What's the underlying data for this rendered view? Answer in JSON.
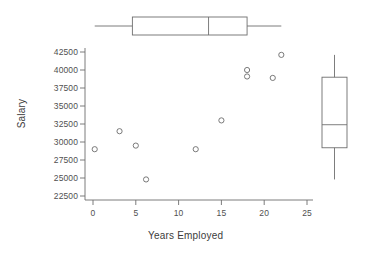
{
  "chart_data": {
    "type": "scatter",
    "title": "",
    "xlabel": "Years Employed",
    "ylabel": "Salary",
    "xlim": [
      -1.5,
      26.5
    ],
    "ylim": [
      21800,
      43600
    ],
    "grid": false,
    "legend": "none",
    "x_ticks": [
      0,
      5,
      10,
      15,
      20,
      25
    ],
    "x_tick_labels": [
      "0",
      "5",
      "10",
      "15",
      "20",
      "25"
    ],
    "y_ticks": [
      22500,
      25000,
      27500,
      30000,
      32500,
      35000,
      37500,
      40000,
      42500
    ],
    "y_tick_labels": [
      "22500",
      "25000",
      "27500",
      "30000",
      "32500",
      "35000",
      "37500",
      "40000",
      "42500"
    ],
    "x": [
      0.2,
      3.1,
      5.0,
      6.2,
      12.0,
      15.0,
      18.0,
      18.0,
      21.0,
      22.0
    ],
    "y": [
      29000,
      31500,
      29500,
      24800,
      29000,
      33000,
      40000,
      39100,
      38900,
      42100
    ],
    "points": [
      {
        "x": 0.2,
        "y": 29000
      },
      {
        "x": 3.1,
        "y": 31500
      },
      {
        "x": 5.0,
        "y": 29500
      },
      {
        "x": 6.2,
        "y": 24800
      },
      {
        "x": 12.0,
        "y": 29000
      },
      {
        "x": 15.0,
        "y": 33000
      },
      {
        "x": 18.0,
        "y": 40000
      },
      {
        "x": 18.0,
        "y": 39100
      },
      {
        "x": 21.0,
        "y": 38900
      },
      {
        "x": 22.0,
        "y": 42100
      }
    ],
    "marker": "open-circle",
    "marker_size": 4,
    "boxplot_x": {
      "orientation": "horizontal",
      "variable": "Years Employed",
      "min": 0.2,
      "q1": 4.6,
      "median": 13.5,
      "q3": 18.0,
      "max": 22.0
    },
    "boxplot_y": {
      "orientation": "vertical",
      "variable": "Salary",
      "min": 24800,
      "q1": 29200,
      "median": 32400,
      "q3": 39000,
      "max": 42100
    }
  },
  "labels": {
    "xaxis": "Years Employed",
    "yaxis": "Salary"
  },
  "colors": {
    "line": "#6e6e6e",
    "marker": "#6b6b6b",
    "text": "#4a4a4a",
    "background": "#ffffff"
  }
}
